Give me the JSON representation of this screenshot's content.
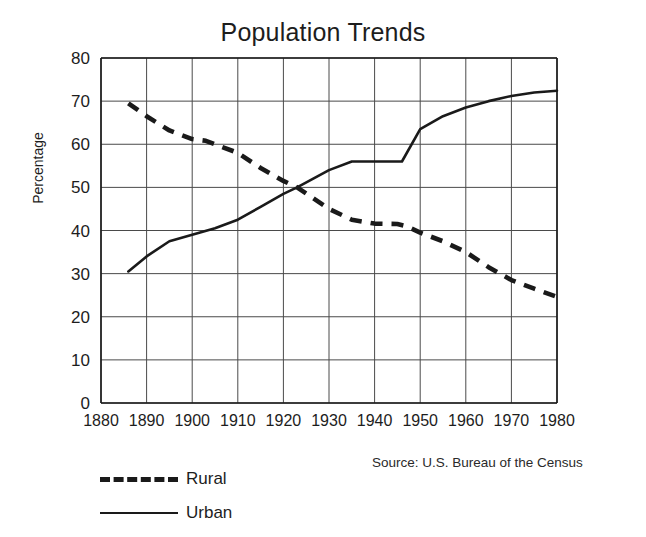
{
  "chart_data": {
    "type": "line",
    "title": "Population Trends",
    "xlabel": "",
    "ylabel": "Percentage",
    "xlim": [
      1880,
      1980
    ],
    "ylim": [
      0,
      80
    ],
    "xticks": [
      1880,
      1890,
      1900,
      1910,
      1920,
      1930,
      1940,
      1950,
      1960,
      1970,
      1980
    ],
    "yticks": [
      0,
      10,
      20,
      30,
      40,
      50,
      60,
      70,
      80
    ],
    "grid": true,
    "legend_position": "below-left",
    "annotations": [
      "Source: U.S. Bureau of the Census"
    ],
    "series": [
      {
        "name": "Rural",
        "style": "dashed",
        "color": "#1a1a1a",
        "x": [
          1886,
          1890,
          1895,
          1900,
          1903,
          1910,
          1915,
          1920,
          1923,
          1930,
          1935,
          1940,
          1945,
          1947,
          1950,
          1955,
          1960,
          1965,
          1970,
          1975,
          1980
        ],
        "values": [
          69.5,
          66.5,
          63.2,
          61.2,
          60.8,
          58.0,
          54.5,
          51.5,
          50.0,
          45.0,
          42.5,
          41.6,
          41.5,
          41.0,
          39.5,
          37.5,
          35.0,
          31.5,
          28.5,
          26.5,
          24.6
        ]
      },
      {
        "name": "Urban",
        "style": "solid",
        "color": "#1a1a1a",
        "x": [
          1886,
          1890,
          1895,
          1900,
          1905,
          1910,
          1915,
          1920,
          1923,
          1930,
          1935,
          1940,
          1946,
          1950,
          1955,
          1960,
          1965,
          1970,
          1975,
          1980
        ],
        "values": [
          30.5,
          34.0,
          37.5,
          39.0,
          40.5,
          42.5,
          45.5,
          48.5,
          50.0,
          54.0,
          56.0,
          56.0,
          56.0,
          63.5,
          66.5,
          68.5,
          70.0,
          71.2,
          72.0,
          72.4
        ]
      }
    ]
  },
  "legend": {
    "items": [
      {
        "label": "Rural",
        "style": "dashed"
      },
      {
        "label": "Urban",
        "style": "solid"
      }
    ]
  },
  "source": {
    "text": "Source: U.S. Bureau of the Census"
  },
  "colors": {
    "ink": "#1a1a1a",
    "grid": "#4a4a4a",
    "background": "#ffffff"
  }
}
